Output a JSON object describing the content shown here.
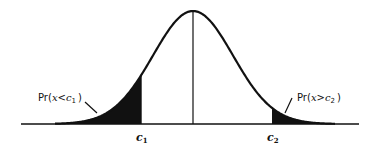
{
  "diagram": {
    "type": "normal-distribution-two-tails",
    "labels": {
      "left_tail": {
        "prefix": "Pr(",
        "var": "x",
        "op": "<",
        "c": "c",
        "sub": "1",
        "suffix": ")"
      },
      "right_tail": {
        "prefix": "Pr(",
        "var": "x",
        "op": ">",
        "c": "c",
        "sub": "2",
        "suffix": ")"
      },
      "c1": {
        "c": "c",
        "sub": "1"
      },
      "c2": {
        "c": "c",
        "sub": "2"
      }
    },
    "colors": {
      "stroke": "#111111",
      "fill": "#111111",
      "background": "#ffffff"
    }
  }
}
